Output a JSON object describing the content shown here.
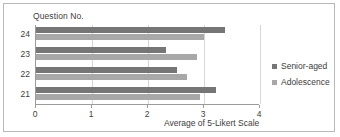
{
  "chart_data": {
    "type": "bar",
    "orientation": "horizontal",
    "title": "",
    "axis_title_y": "Question No.",
    "xlabel": "Average of 5-Likert Scale",
    "ylabel": "Question No.",
    "categories": [
      "21",
      "22",
      "23",
      "24"
    ],
    "xlim": [
      0,
      4
    ],
    "xticks": [
      "0",
      "1",
      "2",
      "3",
      "4"
    ],
    "grid": true,
    "legend_position": "right",
    "series": [
      {
        "name": "Senior-aged",
        "color": "#767676",
        "values": [
          3.21,
          2.52,
          2.32,
          3.38
        ]
      },
      {
        "name": "Adolescence",
        "color": "#a8a8a8",
        "values": [
          2.93,
          2.7,
          2.88,
          3.0
        ]
      }
    ]
  },
  "legend": {
    "items": [
      {
        "label": "Senior-aged",
        "color": "#767676",
        "marker": "square-marker"
      },
      {
        "label": "Adolescence",
        "color": "#a8a8a8",
        "marker": "square-marker"
      }
    ]
  }
}
